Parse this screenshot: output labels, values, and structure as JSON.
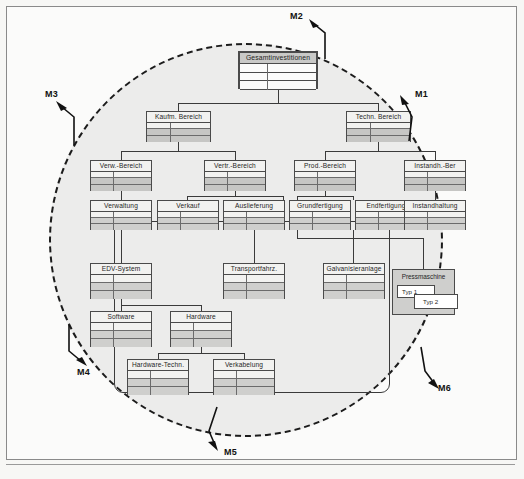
{
  "figure": {
    "type": "hierarchy-diagram",
    "caption": ""
  },
  "markers": [
    {
      "id": "M1",
      "label": "M1",
      "position": "right-upper",
      "arrow": "up-right"
    },
    {
      "id": "M2",
      "label": "M2",
      "position": "top",
      "arrow": "up-left"
    },
    {
      "id": "M3",
      "label": "M3",
      "position": "left-upper",
      "arrow": "up-left"
    },
    {
      "id": "M4",
      "label": "M4",
      "position": "left-lower",
      "arrow": "down-right"
    },
    {
      "id": "M5",
      "label": "M5",
      "position": "bottom",
      "arrow": "down-left"
    },
    {
      "id": "M6",
      "label": "M6",
      "position": "right-lower",
      "arrow": "down-right"
    }
  ],
  "tree": {
    "root": {
      "label": "Gesamtinvestitionen"
    },
    "level1": [
      {
        "label": "Kaufm. Bereich"
      },
      {
        "label": "Techn. Bereich"
      }
    ],
    "level2": [
      {
        "label": "Verw.-Bereich"
      },
      {
        "label": "Vertr.-Bereich"
      },
      {
        "label": "Prod.-Bereich"
      },
      {
        "label": "Instandh.-Ber"
      }
    ],
    "level3": [
      {
        "label": "Verwaltung"
      },
      {
        "label": "Verkauf"
      },
      {
        "label": "Auslieferung"
      },
      {
        "label": "Grundfertigung"
      },
      {
        "label": "Endfertigung"
      },
      {
        "label": "Instandhaltung"
      }
    ],
    "level4": [
      {
        "label": "EDV-System"
      },
      {
        "label": "Transportfahrz."
      },
      {
        "label": "Galvanisieranlage"
      }
    ],
    "level5": [
      {
        "label": "Software"
      },
      {
        "label": "Hardware"
      }
    ],
    "level6": [
      {
        "label": "Hardware-Techn."
      },
      {
        "label": "Verkabelung"
      }
    ],
    "special": {
      "label": "Pressmaschine",
      "variants": [
        {
          "label": "Typ 1"
        },
        {
          "label": "Typ 2"
        }
      ]
    }
  },
  "colors": {
    "page_background": "#f7f7f5",
    "circle_fill": "#ececeb",
    "node_fill": "#f2f2f0",
    "node_shaded_row": "#cfcfcd",
    "root_fill": "#c9c9c7",
    "line": "#3a3a3a",
    "text": "#1f1f1f"
  }
}
